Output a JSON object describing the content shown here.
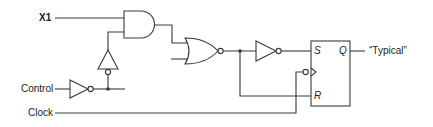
{
  "diagram": {
    "type": "logic-circuit",
    "inputs": [
      {
        "label": "X1"
      },
      {
        "label": "Control"
      },
      {
        "label": "Clock"
      }
    ],
    "gates": [
      {
        "id": "and1",
        "type": "AND"
      },
      {
        "id": "buf1",
        "type": "tri-state buffer (inverted)"
      },
      {
        "id": "inv1",
        "type": "NOT"
      },
      {
        "id": "nor1",
        "type": "NOR"
      },
      {
        "id": "inv2",
        "type": "NOT"
      }
    ],
    "flipflop": {
      "type": "SR",
      "pins": {
        "s": "S",
        "r": "R",
        "q": "Q"
      },
      "clock": "negative-edge"
    },
    "output": {
      "label": "“Typical”"
    },
    "colors": {
      "line": "#3a3a3a",
      "background": "#ffffff"
    }
  }
}
